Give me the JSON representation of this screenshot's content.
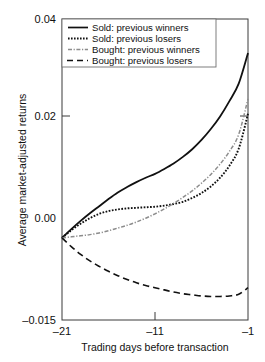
{
  "chart_data": {
    "type": "line",
    "title": "",
    "xlabel": "Trading days before transaction",
    "ylabel": "Average market-adjusted returns",
    "xlim": [
      -21,
      -1
    ],
    "ylim": [
      -0.015,
      0.04
    ],
    "xticks": [
      -21,
      -11,
      -1
    ],
    "xtick_labels": [
      "–21",
      "–11",
      "–1"
    ],
    "yticks": [
      -0.015,
      0.0,
      0.02,
      0.04
    ],
    "ytick_labels": [
      "–0.015",
      "0.00",
      "0.02",
      "0.04"
    ],
    "grid": false,
    "legend_position": "top-left",
    "x": [
      -21,
      -20,
      -19,
      -18,
      -17,
      -16,
      -15,
      -14,
      -13,
      -12,
      -11,
      -10,
      -9,
      -8,
      -7,
      -6,
      -5,
      -4,
      -3,
      -2,
      -1
    ],
    "series": [
      {
        "name": "Sold: previous winners",
        "style": "solid",
        "color": "#111111",
        "values": [
          0.0,
          0.0016,
          0.0031,
          0.0045,
          0.0058,
          0.0071,
          0.0083,
          0.0093,
          0.0102,
          0.011,
          0.0117,
          0.0126,
          0.0136,
          0.0148,
          0.0162,
          0.0179,
          0.0199,
          0.0222,
          0.025,
          0.0282,
          0.0338
        ]
      },
      {
        "name": "Sold: previous losers",
        "style": "dotted",
        "color": "#111111",
        "values": [
          0.0,
          0.0014,
          0.0026,
          0.0036,
          0.0044,
          0.0049,
          0.0052,
          0.0054,
          0.0055,
          0.0056,
          0.0057,
          0.0059,
          0.0062,
          0.0066,
          0.0073,
          0.0082,
          0.0094,
          0.011,
          0.0132,
          0.0163,
          0.0227
        ]
      },
      {
        "name": "Bought: previous winners",
        "style": "dashdot",
        "color": "#8c8c8c",
        "values": [
          0.0,
          0.0002,
          0.0004,
          0.0006,
          0.0009,
          0.0013,
          0.0018,
          0.0023,
          0.0029,
          0.0036,
          0.0044,
          0.0053,
          0.0063,
          0.0074,
          0.0086,
          0.01,
          0.0116,
          0.0135,
          0.0158,
          0.0189,
          0.0254
        ]
      },
      {
        "name": "Bought: previous losers",
        "style": "dashed",
        "color": "#111111",
        "values": [
          0.0,
          -0.0016,
          -0.003,
          -0.0042,
          -0.0052,
          -0.0061,
          -0.0069,
          -0.0076,
          -0.0082,
          -0.0087,
          -0.0091,
          -0.0095,
          -0.0099,
          -0.0102,
          -0.0104,
          -0.0106,
          -0.0107,
          -0.0107,
          -0.0106,
          -0.0103,
          -0.0091
        ]
      }
    ]
  },
  "legend": {
    "entries": [
      {
        "label": "Sold: previous winners"
      },
      {
        "label": "Sold: previous losers"
      },
      {
        "label": "Bought: previous winners"
      },
      {
        "label": "Bought: previous losers"
      }
    ]
  },
  "axes": {
    "y_label": "Average market-adjusted returns",
    "x_label": "Trading days before transaction",
    "y_top": "0.04",
    "y_mid": "0.02",
    "y_zero": "0.00",
    "y_bottom": "–0.015",
    "x_left": "–21",
    "x_mid": "–11",
    "x_right": "–1"
  }
}
